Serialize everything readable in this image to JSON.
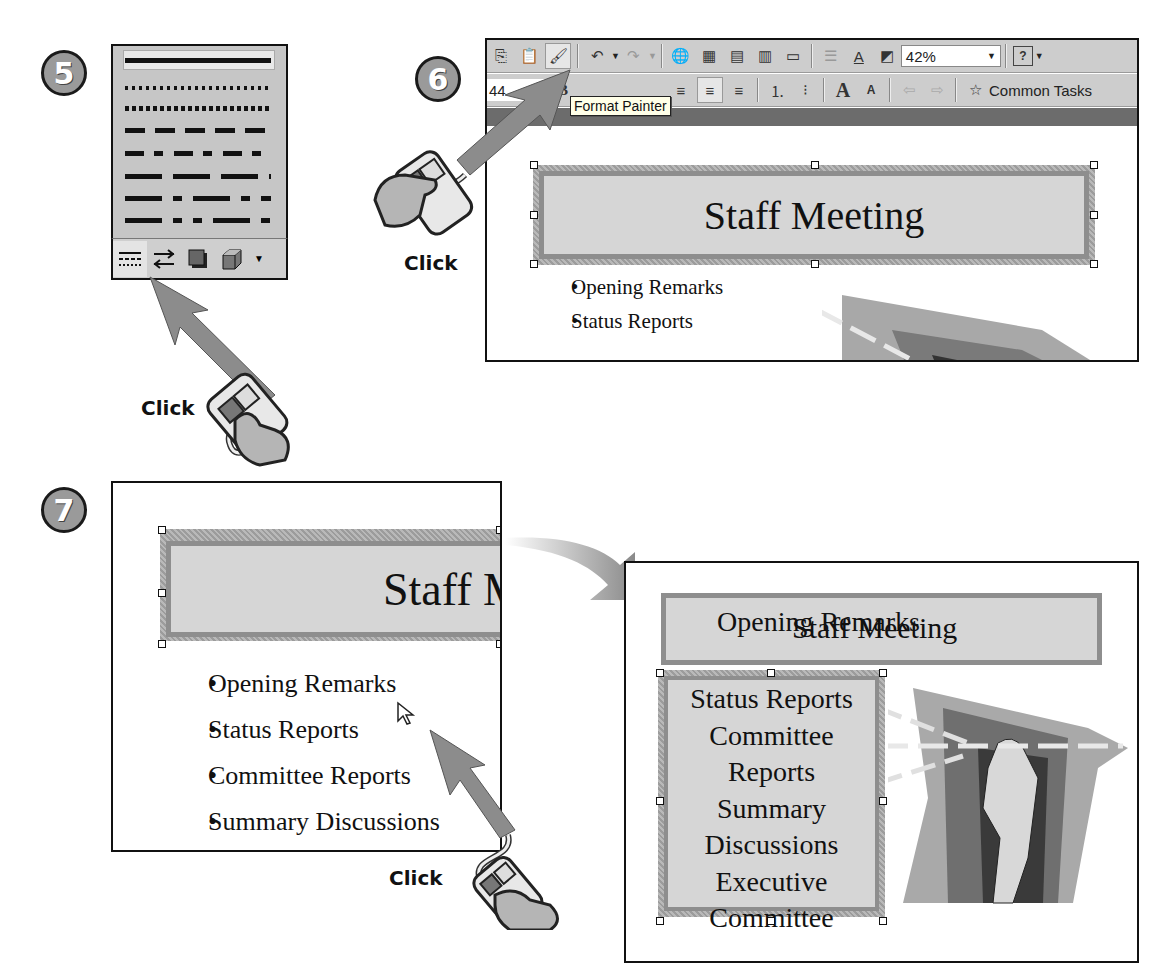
{
  "steps": {
    "step5": {
      "number": "5",
      "click_label": "Click"
    },
    "step6": {
      "number": "6",
      "click_label": "Click"
    },
    "step7": {
      "number": "7",
      "click_label": "Click"
    }
  },
  "line_style_panel": {
    "styles": [
      "solid",
      "round-dot",
      "square-dot",
      "dash",
      "dash-dot",
      "long-dash",
      "long-dash-dot",
      "long-dash-dot-dot"
    ],
    "selected": "solid",
    "toolbar_buttons": [
      {
        "name": "dash-style",
        "icon": "dash-style-icon",
        "active": true
      },
      {
        "name": "arrow-style",
        "icon": "arrow-style-icon"
      },
      {
        "name": "shadow",
        "icon": "shadow-icon"
      },
      {
        "name": "3d",
        "icon": "3d-icon"
      },
      {
        "name": "more",
        "icon": "dropdown-arrow-icon"
      }
    ]
  },
  "powerpoint_window": {
    "toolbar1": {
      "buttons": [
        "copy",
        "paste",
        "format-painter",
        "undo",
        "redo",
        "insert-hyperlink",
        "tables-borders",
        "insert-table",
        "insert-chart",
        "new-slide",
        "expand",
        "show-formatting",
        "grayscale"
      ],
      "zoom_value": "42%",
      "help": "?"
    },
    "toolbar2": {
      "font_size": "44",
      "bold": "B",
      "buttons": [
        "align-left",
        "center",
        "align-right",
        "numbering",
        "bullets",
        "increase-font",
        "decrease-font",
        "promote",
        "demote"
      ],
      "common_tasks": "Common Tasks"
    },
    "tooltip": "Format Painter",
    "slide": {
      "title": "Staff Meeting",
      "bullets": [
        "Opening Remarks",
        "Status Reports"
      ]
    }
  },
  "slide_step7": {
    "title_partial": "Staff M",
    "bullets": [
      "Opening Remarks",
      "Status Reports",
      "Committee Reports",
      "Summary Discussions"
    ]
  },
  "slide_result": {
    "title": "Staff Meeting",
    "overlap_text": "Opening Remarks",
    "body_lines": [
      "Status Reports",
      "Committee",
      "Reports",
      "Summary",
      "Discussions",
      "Executive",
      "Committee"
    ]
  },
  "colors": {
    "frame": "#8e8e8e",
    "fill": "#d6d6d6",
    "toolbar": "#cdcdcd",
    "accent_arrow": "#8a8a8a"
  }
}
